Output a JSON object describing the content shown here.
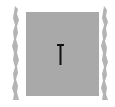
{
  "icon": {
    "name": "text-cursor-i-beam",
    "description": "I-beam text cursor on gray tile with torn paper edges"
  },
  "colors": {
    "background": "#ffffff",
    "tile": "#a9a9a9",
    "torn_edge": "#b4b4b4",
    "cursor": "#111111"
  }
}
